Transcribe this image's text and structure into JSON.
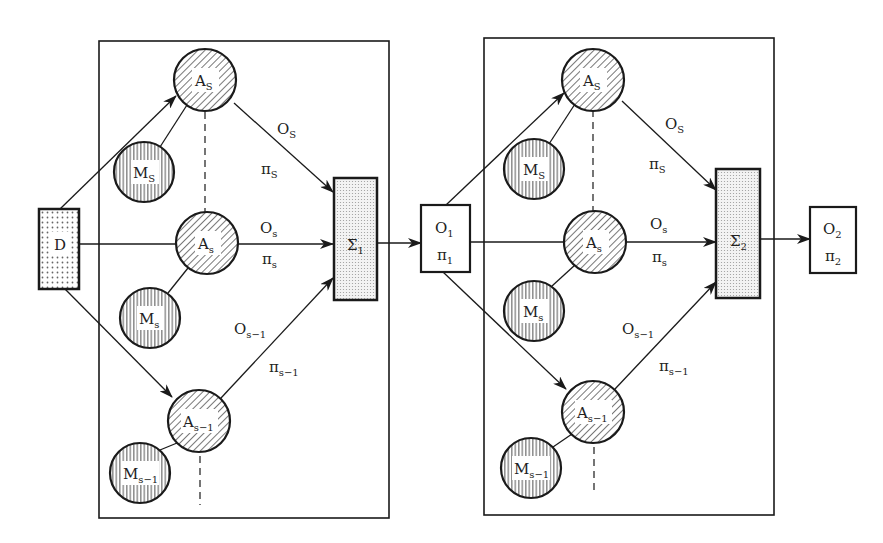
{
  "diagram": {
    "input": {
      "label": "D"
    },
    "stage1": {
      "agents": [
        {
          "a_main": "A",
          "a_sub": "S",
          "m_main": "M",
          "m_sub": "S"
        },
        {
          "a_main": "A",
          "a_sub": "s",
          "m_main": "M",
          "m_sub": "s"
        },
        {
          "a_main": "A",
          "a_sub": "s−1",
          "m_main": "M",
          "m_sub": "s−1"
        }
      ],
      "edges": [
        {
          "o_main": "O",
          "o_sub": "S",
          "p_main": "π",
          "p_sub": "S"
        },
        {
          "o_main": "O",
          "o_sub": "s",
          "p_main": "π",
          "p_sub": "s"
        },
        {
          "o_main": "O",
          "o_sub": "s−1",
          "p_main": "π",
          "p_sub": "s−1"
        }
      ],
      "sum": {
        "main": "Σ",
        "sub": "1"
      },
      "output": {
        "o_main": "O",
        "o_sub": "1",
        "p_main": "π",
        "p_sub": "1"
      }
    },
    "stage2": {
      "agents": [
        {
          "a_main": "A",
          "a_sub": "S",
          "m_main": "M",
          "m_sub": "S"
        },
        {
          "a_main": "A",
          "a_sub": "s",
          "m_main": "M",
          "m_sub": "s"
        },
        {
          "a_main": "A",
          "a_sub": "s−1",
          "m_main": "M",
          "m_sub": "s−1"
        }
      ],
      "edges": [
        {
          "o_main": "O",
          "o_sub": "S",
          "p_main": "π",
          "p_sub": "S"
        },
        {
          "o_main": "O",
          "o_sub": "s",
          "p_main": "π",
          "p_sub": "s"
        },
        {
          "o_main": "O",
          "o_sub": "s−1",
          "p_main": "π",
          "p_sub": "s−1"
        }
      ],
      "sum": {
        "main": "Σ",
        "sub": "2"
      },
      "output": {
        "o_main": "O",
        "o_sub": "2",
        "p_main": "π",
        "p_sub": "2"
      }
    }
  },
  "colors": {
    "stroke": "#1a1a1a",
    "hatch": "#555555",
    "dots": "#777777"
  }
}
